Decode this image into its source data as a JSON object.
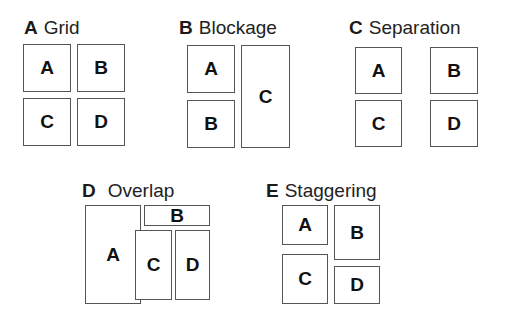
{
  "panels": [
    {
      "letter": "A",
      "name": "Grid",
      "boxes": [
        {
          "label": "A"
        },
        {
          "label": "B"
        },
        {
          "label": "C"
        },
        {
          "label": "D"
        }
      ]
    },
    {
      "letter": "B",
      "name": "Blockage",
      "boxes": [
        {
          "label": "A"
        },
        {
          "label": "B"
        },
        {
          "label": "C"
        }
      ]
    },
    {
      "letter": "C",
      "name": "Separation",
      "boxes": [
        {
          "label": "A"
        },
        {
          "label": "B"
        },
        {
          "label": "C"
        },
        {
          "label": "D"
        }
      ]
    },
    {
      "letter": "D",
      "name": "Overlap",
      "boxes": [
        {
          "label": "A"
        },
        {
          "label": "B"
        },
        {
          "label": "C"
        },
        {
          "label": "D"
        }
      ]
    },
    {
      "letter": "E",
      "name": "Staggering",
      "boxes": [
        {
          "label": "A"
        },
        {
          "label": "B"
        },
        {
          "label": "C"
        },
        {
          "label": "D"
        }
      ]
    }
  ]
}
